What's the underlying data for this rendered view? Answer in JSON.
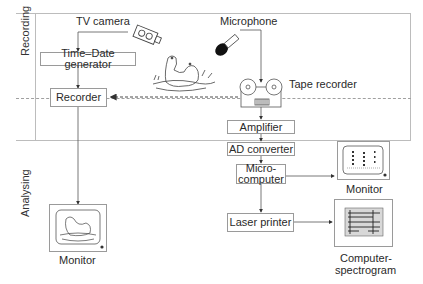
{
  "sections": {
    "recording": "Recording",
    "analysing": "Analysing"
  },
  "recording": {
    "tv_camera": "TV camera",
    "microphone": "Microphone",
    "time_date_generator": "Time–Date generator",
    "recorder": "Recorder",
    "tape_recorder": "Tape recorder"
  },
  "analysing": {
    "amplifier": "Amplifier",
    "ad_converter": "AD converter",
    "microcomputer_line1": "Micro-",
    "microcomputer_line2": "computer",
    "laser_printer": "Laser printer",
    "monitor_left": "Monitor",
    "monitor_right": "Monitor",
    "spectrogram_line1": "Computer-",
    "spectrogram_line2": "spectrogram"
  },
  "icons": [
    "tv-camera-icon",
    "microphone-icon",
    "animals-illustration",
    "tape-recorder-icon",
    "monitor-icon",
    "spectrogram-icon"
  ]
}
